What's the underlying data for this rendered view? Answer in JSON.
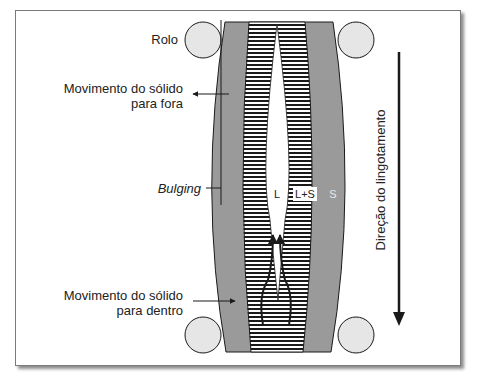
{
  "diagram": {
    "labels": {
      "roll": "Rolo",
      "outward_line1": "Movimento do sólido",
      "outward_line2": "para fora",
      "bulging": "Bulging",
      "inward_line1": "Movimento do sólido",
      "inward_line2": "para dentro",
      "liquid": "L",
      "mushy": "L+S",
      "solid": "S",
      "casting_direction": "Direção do lingotamento"
    },
    "regions": [
      {
        "id": "S",
        "name": "solid shell",
        "color": "#9a9a9a"
      },
      {
        "id": "L+S",
        "name": "mushy zone",
        "pattern": "horizontal stripes"
      },
      {
        "id": "L",
        "name": "liquid core",
        "color": "#ffffff"
      }
    ],
    "rolls": [
      "top-left",
      "top-right",
      "bottom-left",
      "bottom-right"
    ],
    "colors": {
      "solid": "#9a9a9a",
      "roll_fill": "#e6e6e6",
      "stroke": "#1a1a1a",
      "background": "#ffffff"
    }
  }
}
